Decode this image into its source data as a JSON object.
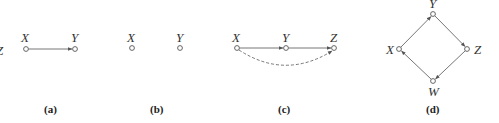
{
  "figure": {
    "partial_left_label": "Z",
    "panels": [
      {
        "id": "a",
        "caption": "(a)",
        "nodes": [
          {
            "name": "X",
            "x": 26,
            "y": 49
          },
          {
            "name": "Y",
            "x": 75,
            "y": 49
          }
        ],
        "edges": [
          {
            "from": "X",
            "to": "Y",
            "style": "solid"
          }
        ]
      },
      {
        "id": "b",
        "caption": "(b)",
        "nodes": [
          {
            "name": "X",
            "x": 132,
            "y": 48
          },
          {
            "name": "Y",
            "x": 180,
            "y": 48
          }
        ],
        "edges": []
      },
      {
        "id": "c",
        "caption": "(c)",
        "nodes": [
          {
            "name": "X",
            "x": 237,
            "y": 48
          },
          {
            "name": "Y",
            "x": 286,
            "y": 48
          },
          {
            "name": "Z",
            "x": 334,
            "y": 48
          }
        ],
        "edges": [
          {
            "from": "X",
            "to": "Y",
            "style": "solid"
          },
          {
            "from": "Y",
            "to": "Z",
            "style": "solid"
          },
          {
            "from": "X",
            "to": "Z",
            "style": "dashed-curved"
          }
        ]
      },
      {
        "id": "d",
        "caption": "(d)",
        "nodes": [
          {
            "name": "Y",
            "x": 433,
            "y": 14
          },
          {
            "name": "X",
            "x": 399,
            "y": 49
          },
          {
            "name": "Z",
            "x": 467,
            "y": 49
          },
          {
            "name": "W",
            "x": 433,
            "y": 81
          }
        ],
        "edges": [
          {
            "from": "X",
            "to": "Y",
            "style": "solid"
          },
          {
            "from": "Y",
            "to": "Z",
            "style": "solid"
          },
          {
            "from": "Z",
            "to": "W",
            "style": "solid"
          },
          {
            "from": "W",
            "to": "X",
            "style": "solid"
          }
        ]
      }
    ]
  },
  "labels": {
    "a": {
      "caption": "(a)",
      "X": "X",
      "Y": "Y"
    },
    "b": {
      "caption": "(b)",
      "X": "X",
      "Y": "Y"
    },
    "c": {
      "caption": "(c)",
      "X": "X",
      "Y": "Y",
      "Z": "Z"
    },
    "d": {
      "caption": "(d)",
      "X": "X",
      "Y": "Y",
      "Z": "Z",
      "W": "W"
    },
    "partial": "Z"
  }
}
